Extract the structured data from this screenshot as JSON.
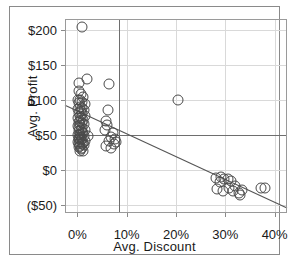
{
  "chart_data": {
    "type": "scatter",
    "title": "",
    "xlabel": "Avg. Discount",
    "ylabel": "Avg. Profit",
    "xlim": [
      -2.5,
      42.5
    ],
    "ylim": [
      -62,
      215
    ],
    "xticks": [
      "0%",
      "10%",
      "20%",
      "30%",
      "40%"
    ],
    "xtick_values": [
      0,
      10,
      20,
      30,
      40
    ],
    "yticks": [
      "$200",
      "$150",
      "$100",
      "$50",
      "$0",
      "($50)"
    ],
    "ytick_values": [
      200,
      150,
      100,
      50,
      0,
      -50
    ],
    "grid": true,
    "legend": "none",
    "marker": "open-circle",
    "reference_lines": [
      {
        "orientation": "horizontal",
        "value": 50,
        "axis": "y"
      },
      {
        "orientation": "vertical",
        "value": 8.5,
        "axis": "x"
      }
    ],
    "trend_line": {
      "x0": -2.5,
      "y0": 92,
      "x1": 42.5,
      "y1": -55
    },
    "points": [
      [
        0.9,
        203
      ],
      [
        0.3,
        124
      ],
      [
        1.9,
        130
      ],
      [
        6.4,
        122
      ],
      [
        0.4,
        112
      ],
      [
        0.8,
        108
      ],
      [
        1.2,
        104
      ],
      [
        0.2,
        100
      ],
      [
        20.5,
        100
      ],
      [
        0.6,
        99
      ],
      [
        1.0,
        96
      ],
      [
        0.3,
        95
      ],
      [
        1.5,
        93
      ],
      [
        0.5,
        90
      ],
      [
        0.9,
        88
      ],
      [
        0.2,
        86
      ],
      [
        1.3,
        85
      ],
      [
        0.7,
        83
      ],
      [
        6.2,
        85
      ],
      [
        0.4,
        81
      ],
      [
        1.0,
        79
      ],
      [
        0.6,
        77
      ],
      [
        1.6,
        76
      ],
      [
        0.2,
        74
      ],
      [
        0.8,
        73
      ],
      [
        1.2,
        71
      ],
      [
        0.5,
        70
      ],
      [
        5.9,
        70
      ],
      [
        0.3,
        68
      ],
      [
        0.9,
        66
      ],
      [
        1.4,
        65
      ],
      [
        0.6,
        64
      ],
      [
        6.1,
        63
      ],
      [
        0.2,
        62
      ],
      [
        1.0,
        60
      ],
      [
        0.4,
        59
      ],
      [
        0.7,
        57
      ],
      [
        5.6,
        57
      ],
      [
        1.5,
        56
      ],
      [
        0.3,
        55
      ],
      [
        0.9,
        53
      ],
      [
        1.1,
        52
      ],
      [
        0.5,
        51
      ],
      [
        7.2,
        52
      ],
      [
        0.2,
        50
      ],
      [
        0.6,
        49
      ],
      [
        1.3,
        48
      ],
      [
        2.2,
        48
      ],
      [
        0.8,
        47
      ],
      [
        6.8,
        47
      ],
      [
        0.4,
        45
      ],
      [
        1.0,
        44
      ],
      [
        0.3,
        43
      ],
      [
        7.6,
        44
      ],
      [
        0.7,
        42
      ],
      [
        1.6,
        41
      ],
      [
        0.5,
        40
      ],
      [
        6.5,
        41
      ],
      [
        0.2,
        39
      ],
      [
        1.1,
        38
      ],
      [
        0.9,
        37
      ],
      [
        7.9,
        39
      ],
      [
        0.4,
        36
      ],
      [
        1.4,
        35
      ],
      [
        0.6,
        33
      ],
      [
        5.8,
        34
      ],
      [
        0.3,
        32
      ],
      [
        1.0,
        31
      ],
      [
        0.8,
        29
      ],
      [
        6.9,
        31
      ],
      [
        0.5,
        27
      ],
      [
        1.2,
        26
      ],
      [
        7.4,
        36
      ],
      [
        28.2,
        -12
      ],
      [
        29.1,
        -10
      ],
      [
        29.8,
        -14
      ],
      [
        28.9,
        -18
      ],
      [
        30.6,
        -13
      ],
      [
        31.2,
        -17
      ],
      [
        28.4,
        -28
      ],
      [
        29.6,
        -30
      ],
      [
        30.8,
        -27
      ],
      [
        32.0,
        -24
      ],
      [
        31.6,
        -31
      ],
      [
        32.8,
        -33
      ],
      [
        33.4,
        -29
      ],
      [
        33.0,
        -36
      ],
      [
        37.2,
        -27
      ],
      [
        38.1,
        -27
      ]
    ]
  }
}
